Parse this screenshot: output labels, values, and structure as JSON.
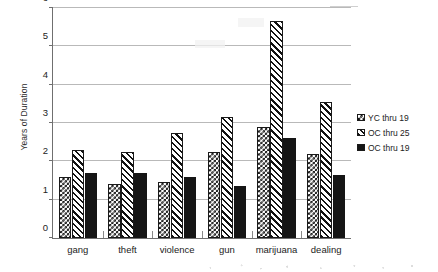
{
  "chart_data": {
    "type": "bar",
    "title": "",
    "subtitle": "",
    "xlabel": "",
    "ylabel": "Years of Duration",
    "categories": [
      "gang",
      "theft",
      "violence",
      "gun",
      "marijuana",
      "dealing"
    ],
    "series": [
      {
        "name": "YC thru 19",
        "pattern": "checkerboard",
        "color": "#111111",
        "values": [
          1.6,
          1.4,
          1.45,
          2.25,
          2.9,
          2.2
        ]
      },
      {
        "name": "OC thru 25",
        "pattern": "diagonal-hatch",
        "color": "#111111",
        "values": [
          2.3,
          2.25,
          2.75,
          3.15,
          5.65,
          3.55
        ]
      },
      {
        "name": "OC thru 19",
        "pattern": "solid",
        "color": "#151515",
        "values": [
          1.7,
          1.7,
          1.6,
          1.35,
          2.6,
          1.65
        ]
      }
    ],
    "ylim": [
      0,
      6
    ],
    "yticks": [
      0,
      1,
      2,
      3,
      4,
      5,
      6
    ],
    "ytick_labels": [
      "0",
      "1",
      "2",
      "3",
      "4",
      "5",
      "6"
    ],
    "grid": true,
    "grid_axis": "y",
    "legend_position": "right"
  },
  "legend": {
    "entries": [
      {
        "label": "YC thru 19"
      },
      {
        "label": "OC thru 25"
      },
      {
        "label": "OC thru 19"
      }
    ]
  }
}
